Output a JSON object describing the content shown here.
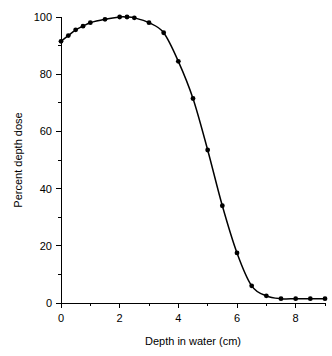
{
  "chart_data": {
    "type": "line",
    "title": "",
    "xlabel": "Depth in water (cm)",
    "ylabel": "Percent depth dose",
    "xlim": [
      0,
      9
    ],
    "ylim": [
      0,
      100
    ],
    "grid": false,
    "legend": "none",
    "x_major_ticks": [
      0,
      2,
      4,
      6,
      8
    ],
    "x_major_tick_labels": [
      "0",
      "2",
      "4",
      "6",
      "8"
    ],
    "x_minor_ticks": [
      1,
      3,
      5,
      7,
      9
    ],
    "y_major_ticks": [
      0,
      20,
      40,
      60,
      80,
      100
    ],
    "y_major_tick_labels": [
      "0",
      "20",
      "40",
      "60",
      "80",
      "100"
    ],
    "y_minor_ticks": [
      10,
      30,
      50,
      70,
      90
    ],
    "series": [
      {
        "name": "Percent depth dose",
        "marker": "filled-circle",
        "line": "solid",
        "color": "#000000",
        "x": [
          0.0,
          0.25,
          0.5,
          0.75,
          1.0,
          1.5,
          2.0,
          2.25,
          2.5,
          3.0,
          3.5,
          4.0,
          4.5,
          5.0,
          5.5,
          6.0,
          6.5,
          7.0,
          7.5,
          8.0,
          8.5,
          9.0
        ],
        "y": [
          91.5,
          93.5,
          95.5,
          96.8,
          98.0,
          99.2,
          100.0,
          100.0,
          99.7,
          98.0,
          94.5,
          84.5,
          71.5,
          53.5,
          34.0,
          17.5,
          6.0,
          2.5,
          1.5,
          1.5,
          1.5,
          1.5
        ]
      }
    ]
  },
  "axes": {
    "x_title": "Depth in water (cm)",
    "y_title": "Percent depth dose"
  }
}
